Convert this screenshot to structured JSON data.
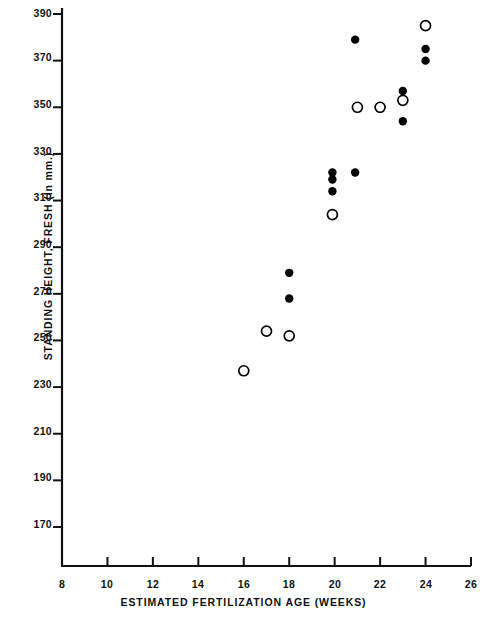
{
  "chart_data": {
    "type": "scatter",
    "title": "",
    "xlabel": "ESTIMATED FERTILIZATION AGE (WEEKS)",
    "ylabel": "STANDING HEIGHT, FRESH (In mm.)",
    "xlim": [
      8,
      26
    ],
    "ylim": [
      160,
      392
    ],
    "xticks": [
      8,
      10,
      12,
      14,
      16,
      18,
      20,
      22,
      24,
      26
    ],
    "xtick_labels": [
      "8",
      "10",
      "12",
      "14",
      "16",
      "18",
      "20",
      "22",
      "24",
      "26"
    ],
    "yticks": [
      170,
      190,
      210,
      230,
      250,
      270,
      290,
      310,
      330,
      350,
      370,
      390
    ],
    "ytick_labels": [
      "170",
      "190",
      "210",
      "230",
      "250",
      "270",
      "290",
      "310",
      "330",
      "350",
      "370",
      "390"
    ],
    "grid": false,
    "legend": "none",
    "axis_color": "#111111",
    "marker_color": "#000000",
    "series": [
      {
        "name": "open-circle",
        "marker": "open-circle",
        "points": [
          {
            "x": 16.0,
            "y": 237
          },
          {
            "x": 17.0,
            "y": 254
          },
          {
            "x": 18.0,
            "y": 252
          },
          {
            "x": 19.9,
            "y": 304
          },
          {
            "x": 21.0,
            "y": 350
          },
          {
            "x": 22.0,
            "y": 350
          },
          {
            "x": 23.0,
            "y": 353
          },
          {
            "x": 24.0,
            "y": 385
          }
        ]
      },
      {
        "name": "filled-circle",
        "marker": "filled-circle",
        "points": [
          {
            "x": 18.0,
            "y": 279
          },
          {
            "x": 18.0,
            "y": 268
          },
          {
            "x": 19.9,
            "y": 322
          },
          {
            "x": 19.9,
            "y": 319
          },
          {
            "x": 19.9,
            "y": 314
          },
          {
            "x": 20.9,
            "y": 379
          },
          {
            "x": 20.9,
            "y": 322
          },
          {
            "x": 23.0,
            "y": 357
          },
          {
            "x": 23.0,
            "y": 344
          },
          {
            "x": 24.0,
            "y": 375
          },
          {
            "x": 24.0,
            "y": 370
          }
        ]
      }
    ]
  }
}
